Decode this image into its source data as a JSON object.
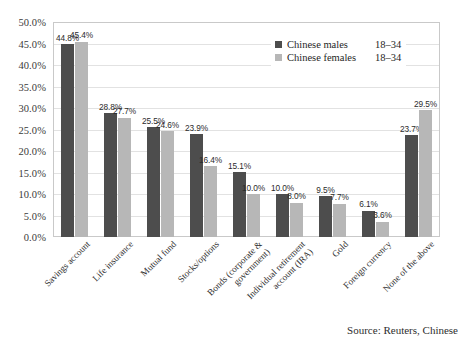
{
  "chart_data": {
    "type": "bar",
    "title": "",
    "xlabel": "",
    "ylabel": "",
    "ylim": [
      0,
      50
    ],
    "ytick_labels": [
      "50.0%",
      "45.0%",
      "40.0%",
      "35.0%",
      "30.0%",
      "25.0%",
      "20.0%",
      "15.0%",
      "10.0%",
      "5.0%",
      "0.0%"
    ],
    "ytick_values": [
      50,
      45,
      40,
      35,
      30,
      25,
      20,
      15,
      10,
      5,
      0
    ],
    "grid": true,
    "legend_position": "top-right",
    "categories": [
      "Savings account",
      "Life insurance",
      "Mutual fund",
      "Stocks/options",
      "Bonds (corporate & government)",
      "Individual retirement account (IRA)",
      "Gold",
      "Foreign currency",
      "None of the above"
    ],
    "category_lines": [
      [
        "Savings account"
      ],
      [
        "Life insurance"
      ],
      [
        "Mutual fund"
      ],
      [
        "Stocks/options"
      ],
      [
        "Bonds (corporate &",
        "government)"
      ],
      [
        "Individual retirement",
        "account (IRA)"
      ],
      [
        "Gold"
      ],
      [
        "Foreign currency"
      ],
      [
        "None of the above"
      ]
    ],
    "series": [
      {
        "name": "Chinese males",
        "age_range": "18–34",
        "color": "#4d4d4d",
        "values": [
          44.8,
          28.8,
          25.5,
          23.9,
          15.1,
          10.0,
          9.5,
          6.1,
          23.7
        ],
        "labels": [
          "44.8%",
          "28.8%",
          "25.5%",
          "23.9%",
          "15.1%",
          "10.0%",
          "9.5%",
          "6.1%",
          "23.7%"
        ]
      },
      {
        "name": "Chinese females",
        "age_range": "18–34",
        "color": "#b7b7b7",
        "values": [
          45.4,
          27.7,
          24.6,
          16.4,
          10.0,
          8.0,
          7.7,
          3.6,
          29.5
        ],
        "labels": [
          "45.4%",
          "27.7%",
          "24.6%",
          "16.4%",
          "10.0%",
          "8.0%",
          "7.7%",
          "3.6%",
          "29.5%"
        ]
      }
    ]
  },
  "legend": {
    "entries": [
      {
        "name": "Chinese males",
        "age": "18–34"
      },
      {
        "name": "Chinese females",
        "age": "18–34"
      }
    ]
  },
  "source": {
    "text": "Source: Reuters, Chinese"
  }
}
